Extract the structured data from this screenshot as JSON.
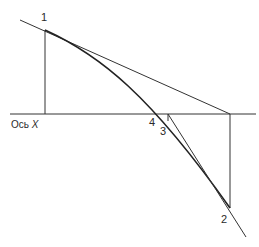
{
  "diagram": {
    "type": "secant-tangent method illustration",
    "axis_label": "Ось",
    "axis_var": "X",
    "points": [
      {
        "id": "1",
        "label": "1"
      },
      {
        "id": "2",
        "label": "2"
      },
      {
        "id": "3",
        "label": "3"
      },
      {
        "id": "4",
        "label": "4"
      }
    ],
    "colors": {
      "stroke": "#222222",
      "background": "#ffffff"
    }
  }
}
